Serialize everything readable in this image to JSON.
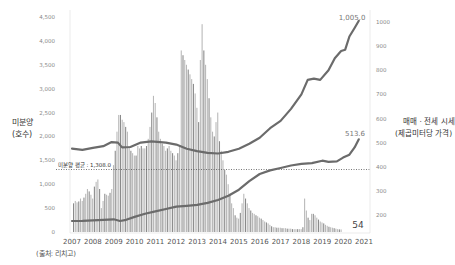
{
  "chart_data": {
    "type": "bar+line",
    "title": "",
    "source": "(출처: 리치고)",
    "left_axis": {
      "label_line1": "미분양",
      "label_line2": "(호수)",
      "ticks": [
        "0",
        "500",
        "1,000",
        "1,500",
        "2,000",
        "2,500",
        "3,000",
        "3,500",
        "4,000",
        "4,500"
      ],
      "range": [
        0,
        4500
      ]
    },
    "right_axis": {
      "label_line1": "매매 · 전세 시세",
      "label_line2": "(제곱미터당 가격)",
      "ticks": [
        "200",
        "300",
        "400",
        "500",
        "600",
        "700",
        "800",
        "900",
        "1000"
      ],
      "range": [
        150,
        1030
      ]
    },
    "x_axis": {
      "ticks": [
        "2007",
        "2008",
        "2009",
        "2010",
        "2011",
        "2012",
        "2013",
        "2014",
        "2015",
        "2016",
        "2017",
        "2018",
        "2019",
        "2020",
        "2021"
      ]
    },
    "average_line": {
      "label": "미분양 평균 : 1,308.0",
      "value": 1308.0
    },
    "annotations": {
      "sale_end": "1,005.0",
      "jeonse_end": "513.6",
      "unsold_end": "54"
    },
    "series": [
      {
        "name": "미분양",
        "kind": "bar",
        "start_year": 2007.0,
        "step_years": 0.0833,
        "values": [
          600,
          650,
          620,
          640,
          700,
          650,
          720,
          800,
          900,
          850,
          780,
          700,
          950,
          1050,
          1100,
          900,
          500,
          650,
          800,
          780,
          760,
          820,
          900,
          1400,
          1700,
          2100,
          2450,
          2450,
          2350,
          2300,
          2200,
          2100,
          1800,
          1700,
          1650,
          1600,
          1600,
          1800,
          1750,
          1800,
          1750,
          1750,
          1800,
          1950,
          2200,
          2500,
          2850,
          2700,
          2400,
          2100,
          1950,
          1850,
          1800,
          1700,
          1750,
          1800,
          1700,
          1650,
          1600,
          1500,
          1650,
          1800,
          3800,
          3700,
          3600,
          3500,
          3400,
          3300,
          3200,
          3100,
          2900,
          2600,
          2300,
          3600,
          4350,
          3800,
          3500,
          3200,
          2800,
          2400,
          2100,
          2000,
          2300,
          2500,
          1900,
          1700,
          1500,
          1300,
          1200,
          1000,
          800,
          600,
          500,
          350,
          300,
          280,
          400,
          600,
          800,
          700,
          600,
          500,
          450,
          400,
          380,
          350,
          330,
          300,
          280,
          250,
          220,
          200,
          180,
          150,
          120,
          100,
          100,
          90,
          90,
          90,
          80,
          80,
          80,
          70,
          70,
          70,
          60,
          60,
          60,
          60,
          60,
          60,
          100,
          700,
          450,
          300,
          250,
          380,
          380,
          350,
          300,
          260,
          220,
          200,
          180,
          150,
          130,
          110,
          100,
          90,
          80,
          70,
          60,
          55,
          54
        ]
      },
      {
        "name": "매매 시세",
        "kind": "line",
        "points": [
          [
            2007.0,
            475
          ],
          [
            2007.5,
            470
          ],
          [
            2008.0,
            478
          ],
          [
            2008.5,
            485
          ],
          [
            2008.9,
            502
          ],
          [
            2009.2,
            500
          ],
          [
            2009.4,
            480
          ],
          [
            2009.8,
            482
          ],
          [
            2010.3,
            500
          ],
          [
            2010.8,
            505
          ],
          [
            2011.5,
            500
          ],
          [
            2012.0,
            492
          ],
          [
            2012.5,
            475
          ],
          [
            2013.0,
            465
          ],
          [
            2013.5,
            458
          ],
          [
            2014.0,
            455
          ],
          [
            2014.5,
            462
          ],
          [
            2015.0,
            475
          ],
          [
            2015.5,
            495
          ],
          [
            2016.0,
            520
          ],
          [
            2016.5,
            560
          ],
          [
            2017.0,
            590
          ],
          [
            2017.5,
            640
          ],
          [
            2018.0,
            700
          ],
          [
            2018.3,
            760
          ],
          [
            2018.6,
            765
          ],
          [
            2018.9,
            760
          ],
          [
            2019.3,
            800
          ],
          [
            2019.6,
            850
          ],
          [
            2019.9,
            880
          ],
          [
            2020.1,
            885
          ],
          [
            2020.3,
            940
          ],
          [
            2020.55,
            975
          ],
          [
            2020.75,
            1005
          ]
        ]
      },
      {
        "name": "전세 시세",
        "kind": "line",
        "points": [
          [
            2007.0,
            175
          ],
          [
            2007.5,
            176
          ],
          [
            2008.0,
            178
          ],
          [
            2008.5,
            180
          ],
          [
            2009.0,
            182
          ],
          [
            2009.3,
            175
          ],
          [
            2009.6,
            180
          ],
          [
            2010.0,
            192
          ],
          [
            2010.5,
            205
          ],
          [
            2011.0,
            215
          ],
          [
            2011.5,
            225
          ],
          [
            2012.0,
            235
          ],
          [
            2012.5,
            238
          ],
          [
            2013.0,
            242
          ],
          [
            2013.5,
            250
          ],
          [
            2014.0,
            262
          ],
          [
            2014.5,
            280
          ],
          [
            2015.0,
            305
          ],
          [
            2015.5,
            340
          ],
          [
            2016.0,
            370
          ],
          [
            2016.5,
            385
          ],
          [
            2017.0,
            395
          ],
          [
            2017.5,
            405
          ],
          [
            2018.0,
            412
          ],
          [
            2018.5,
            415
          ],
          [
            2019.0,
            425
          ],
          [
            2019.3,
            420
          ],
          [
            2019.7,
            422
          ],
          [
            2020.0,
            438
          ],
          [
            2020.3,
            450
          ],
          [
            2020.55,
            480
          ],
          [
            2020.75,
            513.6
          ]
        ]
      }
    ],
    "colors": {
      "bar_main": "#b9b9b9",
      "bar_dark": "#8a8a8a",
      "line": "#6b6b6b",
      "axis_text": "#888888",
      "label_text": "#333333",
      "avg_line": "#555555"
    }
  }
}
